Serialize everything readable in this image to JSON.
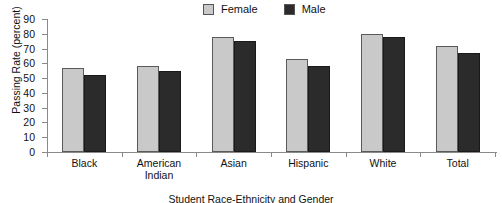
{
  "chart_data": {
    "type": "bar",
    "title": "",
    "xlabel": "Student Race-Ethnicity and Gender",
    "ylabel": "Passing Rate (percent)",
    "categories": [
      "Black",
      "American Indian",
      "Asian",
      "Hispanic",
      "White",
      "Total"
    ],
    "series": [
      {
        "name": "Female",
        "color": "#c9c9c9",
        "values": [
          57,
          58,
          78,
          63,
          80,
          72
        ]
      },
      {
        "name": "Male",
        "color": "#2b2b2b",
        "values": [
          52,
          55,
          75,
          58,
          78,
          67
        ]
      }
    ],
    "ylim": [
      0,
      90
    ],
    "ytick_values": [
      0,
      10,
      20,
      30,
      40,
      50,
      60,
      70,
      80,
      90
    ],
    "ytick_labels": [
      "0",
      "10",
      "20",
      "30",
      "40",
      "50",
      "60",
      "70",
      "80",
      "90"
    ],
    "grid": false,
    "legend_position": "top-center"
  },
  "legend": {
    "entries": [
      {
        "label": "Female",
        "swatch": "legend-swatch-female"
      },
      {
        "label": "Male",
        "swatch": "legend-swatch-male"
      }
    ]
  },
  "category_label_lines": [
    [
      "Black"
    ],
    [
      "American",
      "Indian"
    ],
    [
      "Asian"
    ],
    [
      "Hispanic"
    ],
    [
      "White"
    ],
    [
      "Total"
    ]
  ]
}
